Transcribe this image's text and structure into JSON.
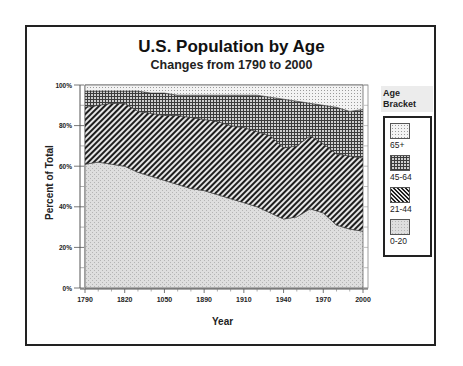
{
  "chart": {
    "title": "U.S. Population by Age",
    "subtitle": "Changes from 1790 to 2000"
  },
  "axes": {
    "xlabel": "Year",
    "ylabel": "Percent of Total",
    "xticks": [
      "1790",
      "1820",
      "1050",
      "1890",
      "1910",
      "1940",
      "1970",
      "2000"
    ],
    "yticks": [
      "0%",
      "20%",
      "40%",
      "60%",
      "80%",
      "100%"
    ]
  },
  "legend": {
    "title": "Age Bracket",
    "items": [
      {
        "label": "65+",
        "pattern": "fine-dots"
      },
      {
        "label": "45-64",
        "pattern": "crosshatch-grid"
      },
      {
        "label": "21-44",
        "pattern": "diagonal-stripes"
      },
      {
        "label": "0-20",
        "pattern": "light-stipple"
      }
    ]
  },
  "chart_data": {
    "type": "area",
    "stacked": true,
    "normalized": "percent",
    "title": "U.S. Population by Age",
    "subtitle": "Changes from 1790 to 2000",
    "xlabel": "Year",
    "ylabel": "Percent of Total",
    "ylim": [
      0,
      100
    ],
    "xlim": [
      1790,
      2000
    ],
    "x_tick_labels": [
      "1790",
      "1820",
      "1050",
      "1890",
      "1910",
      "1940",
      "1970",
      "2000"
    ],
    "y_tick_labels": [
      "0%",
      "20%",
      "40%",
      "60%",
      "80%",
      "100%"
    ],
    "legend_title": "Age Bracket",
    "legend_position": "right",
    "grid": false,
    "x": [
      1790,
      1800,
      1810,
      1820,
      1830,
      1840,
      1850,
      1860,
      1870,
      1880,
      1890,
      1900,
      1910,
      1920,
      1930,
      1940,
      1950,
      1960,
      1970,
      1980,
      1990,
      2000
    ],
    "series": [
      {
        "name": "0-20",
        "values": [
          61,
          62,
          61,
          60,
          57,
          55,
          53,
          51,
          49,
          48,
          46,
          44,
          42,
          40,
          37,
          34,
          35,
          39,
          37,
          31,
          29,
          28
        ]
      },
      {
        "name": "21-44",
        "values": [
          28,
          28,
          30,
          31,
          30,
          31,
          32,
          34,
          35,
          35,
          36,
          36,
          37,
          37,
          38,
          35,
          35,
          36,
          34,
          35,
          36,
          36
        ]
      },
      {
        "name": "45-64",
        "values": [
          8,
          7,
          6,
          6,
          10,
          10,
          11,
          10,
          11,
          12,
          13,
          15,
          16,
          18,
          19,
          24,
          22,
          16,
          19,
          23,
          22,
          24
        ]
      },
      {
        "name": "65+",
        "values": [
          3,
          3,
          3,
          3,
          3,
          4,
          4,
          5,
          5,
          5,
          5,
          5,
          5,
          5,
          6,
          7,
          8,
          9,
          10,
          11,
          13,
          12
        ]
      }
    ]
  }
}
